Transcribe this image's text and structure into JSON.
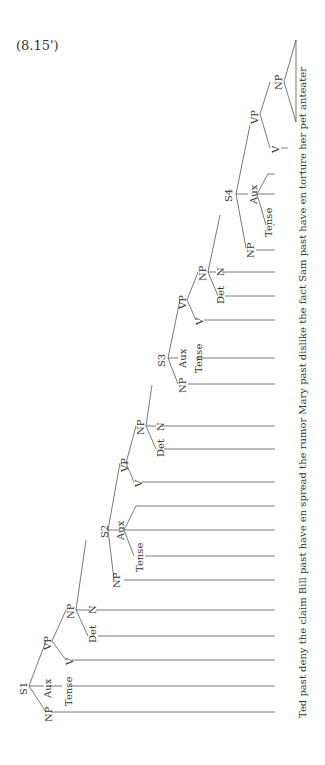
{
  "example_label": "(8.15')",
  "sentence": "Ted past deny the claim Bill past have en spread the rumor Mary past dislike the fact Sam past have en torture her pet anteater",
  "nodes": {
    "s1": "S1",
    "s1_np": "NP",
    "s1_aux": "Aux",
    "s1_tense": "Tense",
    "s1_vp": "VP",
    "s1_v": "V",
    "s1_np2": "NP",
    "s1_det": "Det",
    "s1_n": "N",
    "s2": "S2",
    "s2_np": "NP",
    "s2_aux": "Aux",
    "s2_tense": "Tense",
    "s2_vp": "VP",
    "s2_v": "V",
    "s2_np2": "NP",
    "s2_det": "Det",
    "s2_n": "N",
    "s3": "S3",
    "s3_np": "NP",
    "s3_aux": "Aux",
    "s3_tense": "Tense",
    "s3_vp": "VP",
    "s3_v": "V",
    "s3_np2": "NP",
    "s3_det": "Det",
    "s3_n": "N",
    "s4": "S4",
    "s4_np": "NP",
    "s4_aux": "Aux",
    "s4_tense": "Tense",
    "s4_vp": "VP",
    "s4_v": "V",
    "s4_np2": "NP"
  },
  "leaves": [
    "Ted",
    "past",
    "deny",
    "the",
    "claim",
    "Bill",
    "past",
    "have",
    "en",
    "spread",
    "the",
    "rumor",
    "Mary",
    "past",
    "dislike",
    "the",
    "fact",
    "Sam",
    "past",
    "have",
    "en",
    "torture",
    "her pet anteater"
  ]
}
